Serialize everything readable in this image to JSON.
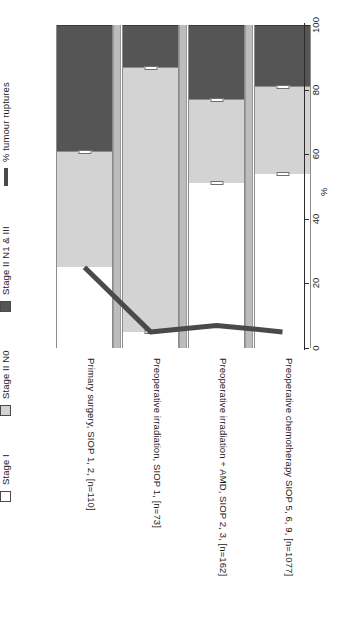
{
  "legend": {
    "items": [
      {
        "label": "Stage I",
        "swatch": "white-square-icon",
        "color": "#ffffff"
      },
      {
        "label": "Stage II N0",
        "swatch": "light-gray-square-icon",
        "color": "#d3d3d3"
      },
      {
        "label": "Stage II N1 & III",
        "swatch": "dark-gray-square-icon",
        "color": "#555555"
      },
      {
        "label": "% tumour ruptures",
        "swatch": "line-segment-icon",
        "color": "#4a4a4a"
      }
    ]
  },
  "axis": {
    "title": "%",
    "ticks": [
      "0",
      "20",
      "40",
      "60",
      "80",
      "100"
    ]
  },
  "chart_data": {
    "type": "bar",
    "title": "",
    "subtitle": "",
    "xlabel": "",
    "ylabel": "%",
    "ylim": [
      0,
      100
    ],
    "grid": false,
    "orientation": "vertical-stacked-rotated",
    "legend_position": "left-rotated",
    "categories": [
      "Primary surgery, SIOP 1, 2, [n=110]",
      "Preoperative irradiation, SIOP 1, [n=73]",
      "Preoperative irradiation + AMD, SIOP 2, 3, [n=162]",
      "Preoperative chemotherapy SIOP 5, 6, 9, [n=1077]"
    ],
    "series": [
      {
        "name": "Stage I",
        "color": "#ffffff",
        "values": [
          25,
          87,
          51,
          54
        ]
      },
      {
        "name": "Stage II N0",
        "color": "#d3d3d3",
        "values": [
          36,
          0,
          26,
          27
        ]
      },
      {
        "name": "Stage II N1 & III",
        "color": "#555555",
        "values": [
          39,
          13,
          23,
          19
        ]
      }
    ],
    "cumulative_tops": {
      "Stage I": [
        25,
        87,
        51,
        54
      ],
      "Stage I + Stage II N0": [
        61,
        87,
        77,
        81
      ],
      "total": [
        100,
        100,
        100,
        100
      ]
    },
    "overlay_line": {
      "name": "% tumour ruptures",
      "color": "#4a4a4a",
      "values": [
        25,
        5,
        7,
        5
      ]
    }
  }
}
